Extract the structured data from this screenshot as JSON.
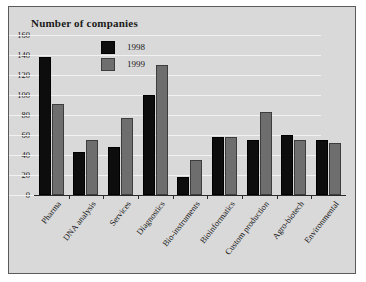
{
  "chart_data": {
    "type": "bar",
    "title": "Number of companies",
    "xlabel": "",
    "ylabel": "",
    "ylim": [
      0,
      160
    ],
    "yticks": [
      0,
      20,
      40,
      60,
      80,
      100,
      120,
      140,
      160
    ],
    "grid": true,
    "legend_position": "top-center",
    "categories": [
      "Pharma",
      "DNA analysis",
      "Services",
      "Diagnostics",
      "Bio-instruments",
      "Bioinformatics",
      "Custom production",
      "Agro-biotech",
      "Environmental"
    ],
    "series": [
      {
        "name": "1998",
        "color": "#0d0d0d",
        "values": [
          138,
          43,
          48,
          100,
          18,
          58,
          55,
          60,
          55
        ]
      },
      {
        "name": "1999",
        "color": "#6e6e6e",
        "values": [
          91,
          55,
          77,
          130,
          35,
          58,
          83,
          55,
          52
        ]
      }
    ]
  },
  "colors": {
    "panel_background": "#d9d9d9",
    "panel_border": "#5a5a5a",
    "gridline": "#f2f2f2",
    "axis": "#2a2a2a",
    "series_1998": "#0d0d0d",
    "series_1999": "#6e6e6e",
    "text": "#1a1a1a"
  }
}
